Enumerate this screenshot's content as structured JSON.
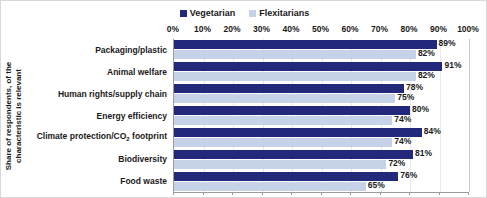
{
  "chart_data": {
    "type": "bar",
    "orientation": "horizontal",
    "title": "",
    "subtitle": "",
    "xlabel": "",
    "ylabel": "Share of respondents, of the characteristic is relevant",
    "ylabel_lines": [
      "Share of respondents, of the",
      "characteristic is relevant"
    ],
    "xlim": [
      0,
      100
    ],
    "x_tick_labels": [
      "0%",
      "10%",
      "20%",
      "30%",
      "40%",
      "50%",
      "60%",
      "70%",
      "80%",
      "90%",
      "100%"
    ],
    "x_tick_values": [
      0,
      10,
      20,
      30,
      40,
      50,
      60,
      70,
      80,
      90,
      100
    ],
    "grid": true,
    "legend_position": "top-center",
    "categories": [
      "Packaging/plastic",
      "Animal welfare",
      "Human rights/supply chain",
      "Energy efficiency",
      "Climate protection/CO2 footprint",
      "Biodiversity",
      "Food waste"
    ],
    "series": [
      {
        "name": "Vegetarian",
        "color": "#22297A",
        "values": [
          89,
          91,
          78,
          80,
          84,
          81,
          76
        ],
        "value_labels": [
          "89%",
          "91%",
          "78%",
          "80%",
          "84%",
          "81%",
          "76%"
        ]
      },
      {
        "name": "Flexitarians",
        "color": "#C6D2E8",
        "values": [
          82,
          82,
          75,
          74,
          74,
          72,
          65
        ],
        "value_labels": [
          "82%",
          "82%",
          "75%",
          "74%",
          "74%",
          "72%",
          "65%"
        ]
      }
    ]
  },
  "category_labels_html": [
    "Packaging/plastic",
    "Animal welfare",
    "Human rights/supply chain",
    "Energy efficiency",
    "Climate protection/CO<sub>2</sub> footprint",
    "Biodiversity",
    "Food waste"
  ],
  "legend": {
    "items": [
      {
        "label": "Vegetarian",
        "color": "#22297A"
      },
      {
        "label": "Flexitarians",
        "color": "#C6D2E8"
      }
    ]
  },
  "colors": {
    "vegetarian": "#22297A",
    "flexitarians": "#C6D2E8",
    "axis": "#9A9A9A",
    "gridline": "#E8E8EE",
    "text": "#1A1A1A",
    "border": "#D8D8D8",
    "background": "#FFFFFF"
  }
}
